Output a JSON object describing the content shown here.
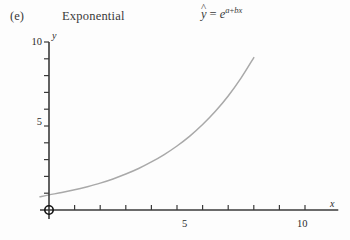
{
  "panel": {
    "label": "(e)",
    "title": "Exponential"
  },
  "formula": {
    "lhs_var": "y",
    "hat": "^",
    "equals": "=",
    "base": "e",
    "exp_a": "a",
    "exp_plus": "+",
    "exp_b": "b",
    "exp_x": "x",
    "plain": "ŷ = e^(a+bx)"
  },
  "colors": {
    "background": "#fdfdfd",
    "axis": "#3a3a3a",
    "curve": "#a9a9a9",
    "text": "#2b2b2b",
    "marker": "#111111"
  },
  "chart_data": {
    "type": "line",
    "title": "Exponential",
    "annotations": [
      "(e)",
      "ŷ = e^(a+bx)"
    ],
    "xlabel": "x",
    "ylabel": "y",
    "xlim": [
      0,
      11.3
    ],
    "ylim": [
      0,
      10
    ],
    "grid": false,
    "legend": false,
    "x_ticks": [
      0,
      1,
      2,
      3,
      4,
      5,
      6,
      7,
      8,
      9,
      10
    ],
    "x_tick_labels": [
      "",
      "",
      "",
      "",
      "",
      "5",
      "",
      "",
      "",
      "",
      "10"
    ],
    "y_ticks": [
      0,
      1,
      2,
      3,
      4,
      5,
      6,
      7,
      8,
      9,
      10
    ],
    "y_tick_labels": [
      "",
      "",
      "",
      "",
      "",
      "5",
      "",
      "",
      "",
      "",
      "10"
    ],
    "origin_marker": {
      "shape": "open-circle",
      "x": 0,
      "y": 0
    },
    "series": [
      {
        "name": "ŷ = e^(a+bx)",
        "color": "#a9a9a9",
        "x": [
          -0.35,
          0,
          0.5,
          1,
          1.5,
          2,
          2.5,
          3,
          3.5,
          4,
          4.5,
          5,
          5.5,
          6,
          6.5,
          7,
          7.5,
          8,
          8.5,
          9,
          9.55
        ],
        "y": [
          0.79,
          0.9,
          1.04,
          1.2,
          1.39,
          1.6,
          1.85,
          2.14,
          2.47,
          2.86,
          3.3,
          3.81,
          4.4,
          5.09,
          5.88,
          6.79,
          7.85,
          9.07,
          10.48,
          12.11,
          14.15
        ]
      }
    ]
  }
}
